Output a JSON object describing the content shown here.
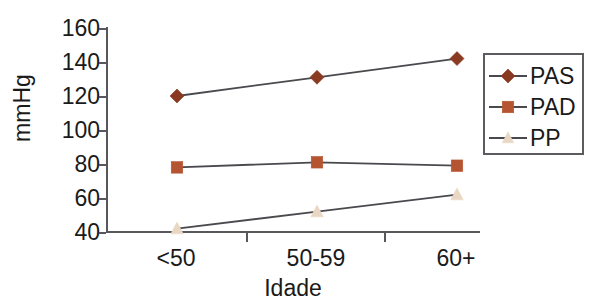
{
  "chart_data": {
    "type": "line",
    "title": "",
    "subtitle": "",
    "xlabel": "Idade",
    "ylabel": "mmHg",
    "categories": [
      "<50",
      "50-59",
      "60+"
    ],
    "ylim": [
      40,
      160
    ],
    "yticks": [
      40,
      60,
      80,
      100,
      120,
      140,
      160
    ],
    "grid": false,
    "legend_position": "right",
    "series": [
      {
        "name": "PAS",
        "marker": "diamond",
        "color": "#8B3A22",
        "line_color": "#4a4a4e",
        "values": [
          120,
          131,
          142
        ]
      },
      {
        "name": "PAD",
        "marker": "square",
        "color": "#B55430",
        "line_color": "#4a4a4e",
        "values": [
          78,
          81,
          79
        ]
      },
      {
        "name": "PP",
        "marker": "triangle",
        "color": "#E9D7C3",
        "line_color": "#4a4a4e",
        "values": [
          42,
          52,
          62
        ]
      }
    ]
  },
  "axis": {
    "y_title": "mmHg",
    "x_title": "Idade",
    "y_tick_labels": [
      "160",
      "140",
      "120",
      "100",
      "80",
      "60",
      "40"
    ],
    "x_tick_labels": [
      "<50",
      "50-59",
      "60+"
    ]
  },
  "legend": {
    "entries": [
      {
        "label": "PAS"
      },
      {
        "label": "PAD"
      },
      {
        "label": "PP"
      }
    ]
  },
  "colors": {
    "pas": "#8B3A22",
    "pad": "#B55430",
    "pp": "#E9D7C3",
    "line": "#4a4a4e",
    "axis": "#58585c",
    "text": "#1a1a1a",
    "background": "#ffffff"
  }
}
